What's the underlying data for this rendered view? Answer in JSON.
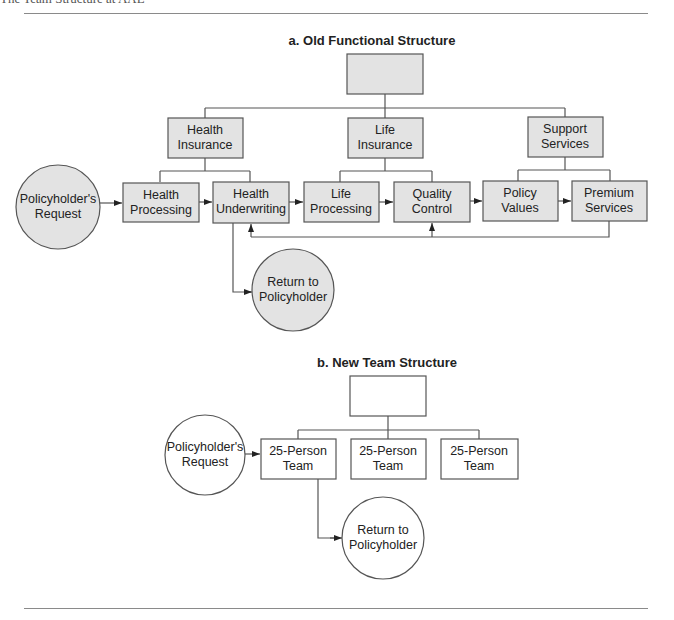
{
  "header": {
    "title": "The Team Structure at AAL"
  },
  "old_structure": {
    "title": "a. Old Functional Structure",
    "departments": [
      {
        "line1": "Health",
        "line2": "Insurance"
      },
      {
        "line1": "Life",
        "line2": "Insurance"
      },
      {
        "line1": "Support",
        "line2": "Services"
      }
    ],
    "steps": [
      {
        "line1": "Health",
        "line2": "Processing"
      },
      {
        "line1": "Health",
        "line2": "Underwriting"
      },
      {
        "line1": "Life",
        "line2": "Processing"
      },
      {
        "line1": "Quality",
        "line2": "Control"
      },
      {
        "line1": "Policy",
        "line2": "Values"
      },
      {
        "line1": "Premium",
        "line2": "Services"
      }
    ],
    "start": {
      "line1": "Policyholder's",
      "line2": "Request"
    },
    "end": {
      "line1": "Return to",
      "line2": "Policyholder"
    }
  },
  "new_structure": {
    "title": "b. New Team Structure",
    "teams": [
      {
        "line1": "25-Person",
        "line2": "Team"
      },
      {
        "line1": "25-Person",
        "line2": "Team"
      },
      {
        "line1": "25-Person",
        "line2": "Team"
      }
    ],
    "start": {
      "line1": "Policyholder's",
      "line2": "Request"
    },
    "end": {
      "line1": "Return to",
      "line2": "Policyholder"
    }
  },
  "colors": {
    "node_fill": "#e3e3e3",
    "stroke": "#555555"
  }
}
